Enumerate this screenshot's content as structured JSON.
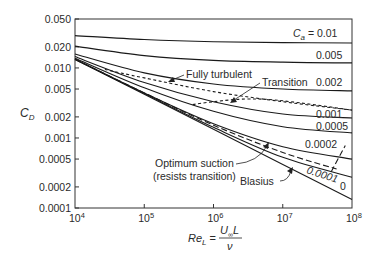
{
  "chart_data": {
    "type": "line",
    "title": "",
    "xlabel": "Re_L = U∞L / ν",
    "ylabel": "C_D",
    "xscale": "log",
    "yscale": "log",
    "xlim": [
      10000,
      100000000
    ],
    "ylim": [
      0.0001,
      0.05
    ],
    "grid": false,
    "x_ticks": [
      {
        "value": 10000,
        "base": "10",
        "exp": "4"
      },
      {
        "value": 100000,
        "base": "10",
        "exp": "5"
      },
      {
        "value": 1000000,
        "base": "10",
        "exp": "6"
      },
      {
        "value": 10000000,
        "base": "10",
        "exp": "7"
      },
      {
        "value": 100000000,
        "base": "10",
        "exp": "8"
      }
    ],
    "y_ticks": [
      {
        "value": 0.05,
        "label": "0.050"
      },
      {
        "value": 0.02,
        "label": "0.020"
      },
      {
        "value": 0.01,
        "label": "0.010"
      },
      {
        "value": 0.005,
        "label": "0.005"
      },
      {
        "value": 0.002,
        "label": "0.002"
      },
      {
        "value": 0.001,
        "label": "0.001"
      },
      {
        "value": 0.0005,
        "label": "0.0005"
      },
      {
        "value": 0.0002,
        "label": "0.0002"
      },
      {
        "value": 0.0001,
        "label": "0.0001"
      }
    ],
    "series": [
      {
        "name": "Ca = 0.01",
        "label": "0.01",
        "style": "solid",
        "x": [
          10000,
          100000,
          1000000,
          10000000,
          100000000
        ],
        "y": [
          0.029,
          0.0255,
          0.0237,
          0.023,
          0.0227
        ]
      },
      {
        "name": "Ca = 0.005",
        "label": "0.005",
        "style": "solid",
        "x": [
          10000,
          100000,
          1000000,
          10000000,
          100000000
        ],
        "y": [
          0.0205,
          0.015,
          0.0128,
          0.0121,
          0.0118
        ]
      },
      {
        "name": "Ca = 0.002",
        "label": "0.002",
        "style": "solid",
        "x": [
          10000,
          100000,
          1000000,
          10000000,
          100000000
        ],
        "y": [
          0.0158,
          0.0085,
          0.0059,
          0.005,
          0.0047
        ]
      },
      {
        "name": "Ca = 0.001",
        "label": "0.001",
        "style": "solid",
        "x": [
          10000,
          100000,
          1000000,
          10000000,
          100000000
        ],
        "y": [
          0.0145,
          0.0062,
          0.0033,
          0.0022,
          0.00193
        ]
      },
      {
        "name": "Ca = 0.0005",
        "label": "0.0005",
        "style": "solid",
        "x": [
          10000,
          100000,
          1000000,
          10000000,
          100000000
        ],
        "y": [
          0.0138,
          0.0052,
          0.0024,
          0.00145,
          0.00118
        ]
      },
      {
        "name": "Ca = 0.0002",
        "label": "0.0002",
        "style": "solid",
        "x": [
          10000,
          100000,
          1000000,
          10000000,
          100000000
        ],
        "y": [
          0.0134,
          0.0044,
          0.0016,
          0.00075,
          0.0005
        ]
      },
      {
        "name": "Ca = 0.0001",
        "label": "0.0001",
        "style": "solid",
        "x": [
          10000,
          100000,
          1000000,
          10000000,
          100000000
        ],
        "y": [
          0.0132,
          0.0043,
          0.00142,
          0.00053,
          0.000275
        ]
      },
      {
        "name": "Ca = 0 (Blasius)",
        "label": "0",
        "style": "solid",
        "x": [
          10000,
          100000,
          1000000,
          10000000,
          100000000
        ],
        "y": [
          0.01328,
          0.0042,
          0.001328,
          0.00042,
          0.0001328
        ]
      },
      {
        "name": "Fully turbulent",
        "label": "Fully turbulent",
        "style": "dashed",
        "x": [
          27000,
          100000,
          1000000,
          10000000,
          100000000
        ],
        "y": [
          0.0095,
          0.0072,
          0.0046,
          0.0033,
          0.0025
        ]
      },
      {
        "name": "Transition",
        "label": "Transition",
        "style": "dashed",
        "x": [
          500000,
          1000000,
          3000000,
          10000000,
          100000000
        ],
        "y": [
          0.003,
          0.0033,
          0.0036,
          0.0034,
          0.0025
        ]
      },
      {
        "name": "Optimum suction (resists transition)",
        "label": "Optimum suction (resists transition)",
        "style": "dashed",
        "x": [
          10000,
          100000,
          1000000,
          10000000,
          60000000
        ],
        "y": [
          0.0133,
          0.0044,
          0.00152,
          0.00062,
          0.00036
        ]
      },
      {
        "name": "Optimum suction transition branch",
        "label": "",
        "style": "dashed",
        "x": [
          50000000,
          80000000
        ],
        "y": [
          0.00033,
          0.00078
        ]
      }
    ],
    "annotations": [
      {
        "text": "Fully turbulent",
        "x": 520000,
        "y": 0.011
      },
      {
        "text": "Transition",
        "x": 12000000,
        "y": 0.004
      },
      {
        "text": "Optimum suction",
        "x": 140000,
        "y": 0.00062
      },
      {
        "text": "(resists transition)",
        "x": 140000,
        "y": 0.00044
      },
      {
        "text": "Blasius",
        "x": 1800000,
        "y": 0.00031
      }
    ]
  },
  "labels": {
    "ylabel_main": "C",
    "ylabel_sub": "D",
    "ca_prefix_main": "C",
    "ca_prefix_sub": "a",
    "ca_eq": " = 0.01",
    "xlabel_main": "Re",
    "xlabel_sub": "L",
    "xlabel_eq": " = ",
    "xlabel_num": "U",
    "xlabel_num_sub": "∞",
    "xlabel_num_tail": "L",
    "xlabel_den": "ν",
    "curve_labels": {
      "ca005": "0.005",
      "ca002": "0.002",
      "ca001": "0.001",
      "ca0005": "0.0005",
      "ca0002": "0.0002",
      "ca0001": "0.0001",
      "ca0": "0"
    },
    "annot_fully_turbulent": "Fully turbulent",
    "annot_transition": "Transition",
    "annot_optimum_1": "Optimum suction",
    "annot_optimum_2": "(resists transition)",
    "annot_blasius": "Blasius"
  }
}
